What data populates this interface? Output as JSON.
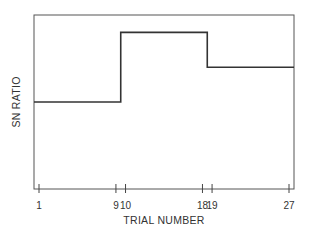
{
  "chart_data": {
    "type": "line",
    "subtype": "step",
    "title": "",
    "xlabel": "TRIAL NUMBER",
    "ylabel": "SN RATIO",
    "x_ticks": [
      1,
      9,
      10,
      18,
      19,
      27
    ],
    "xlim": [
      1,
      27
    ],
    "ylim": [
      0,
      100
    ],
    "y_ticks_shown": false,
    "grid": false,
    "legend": null,
    "series": [
      {
        "name": "SN ratio",
        "segments": [
          {
            "x_start": 1,
            "x_end": 9.5,
            "y": 50
          },
          {
            "x_start": 9.5,
            "x_end": 18.5,
            "y": 90
          },
          {
            "x_start": 18.5,
            "x_end": 27,
            "y": 70
          }
        ]
      }
    ]
  },
  "labels": {
    "xlabel": "TRIAL NUMBER",
    "ylabel": "SN RATIO",
    "ticks": [
      "1",
      "9",
      "10",
      "18",
      "19",
      "27"
    ]
  }
}
